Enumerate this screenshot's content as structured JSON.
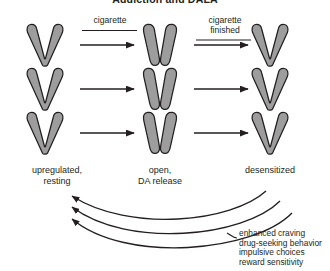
{
  "figure": {
    "title": "Addiction and DALA",
    "background_color": "#ffffff",
    "receptor_fill": "#9d9d9d",
    "receptor_stroke": "#231f20",
    "text_color": "#231f20"
  },
  "transition_labels": [
    {
      "id": "cigarette",
      "line1": "cigarette",
      "line2": ""
    },
    {
      "id": "cigarette-finished",
      "line1": "cigarette",
      "line2": "finished"
    }
  ],
  "columns": [
    {
      "id": "upregulated-resting",
      "line1": "upregulated,",
      "line2": "resting",
      "state": "closed"
    },
    {
      "id": "open-da-release",
      "line1": "open,",
      "line2": "DA release",
      "state": "open"
    },
    {
      "id": "desensitized",
      "line1": "desensitized",
      "line2": "",
      "state": "closed"
    }
  ],
  "outcomes": [
    "enhanced craving",
    "drug-seeking behavior",
    "impulsive choices",
    "reward sensitivity"
  ],
  "feedback": {
    "arrow_count": 3,
    "direction": "right-to-left",
    "pointer_icon": "curved-arrow-left-icon"
  },
  "receptor_rows": 3
}
